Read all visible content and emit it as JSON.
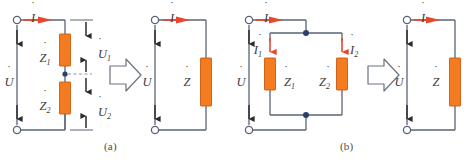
{
  "figure": {
    "type": "circuit-equivalence-diagram",
    "captions": [
      {
        "id": "a",
        "label": "(a)"
      },
      {
        "id": "b",
        "label": "(b)"
      }
    ],
    "colors": {
      "wire": "#5a6475",
      "impedance_fill": "#F47B20",
      "impedance_stroke": "#c85a10",
      "current_arrow": "#E8472B",
      "node_dot": "#2a3f6e",
      "terminal_stroke": "#5a6475",
      "terminal_fill": "#ffffff",
      "label_text": "#3b3b3b",
      "block_arrow_stroke": "#6b7380",
      "dashed_line": "#8a94a3",
      "caption_text": "#4a4a4a",
      "background": "#ffffff"
    }
  },
  "panel_a": {
    "name": "series-circuit-equivalence",
    "left_circuit": {
      "name": "series-circuit",
      "source_label": {
        "symbol": "U",
        "accent": "dot",
        "sub": ""
      },
      "current_label": {
        "symbol": "I",
        "accent": "dot",
        "sub": ""
      },
      "impedances": [
        {
          "symbol": "Z",
          "accent": "dot",
          "sub": "1"
        },
        {
          "symbol": "Z",
          "accent": "dot",
          "sub": "2"
        }
      ],
      "voltage_drops": [
        {
          "symbol": "U",
          "accent": "dot",
          "sub": "1"
        },
        {
          "symbol": "U",
          "accent": "dot",
          "sub": "2"
        }
      ],
      "terminals": 2,
      "midpoint_node": true
    },
    "arrow": {
      "name": "equivalence-arrow",
      "direction": "right"
    },
    "right_circuit": {
      "name": "equivalent-circuit",
      "source_label": {
        "symbol": "U",
        "accent": "dot",
        "sub": ""
      },
      "current_label": {
        "symbol": "I",
        "accent": "dot",
        "sub": ""
      },
      "impedances": [
        {
          "symbol": "Z",
          "accent": "dot",
          "sub": ""
        }
      ],
      "terminals": 2
    }
  },
  "panel_b": {
    "name": "parallel-circuit-equivalence",
    "left_circuit": {
      "name": "parallel-circuit",
      "source_label": {
        "symbol": "U",
        "accent": "dot",
        "sub": ""
      },
      "current_label": {
        "symbol": "I",
        "accent": "dot",
        "sub": ""
      },
      "branch_currents": [
        {
          "symbol": "I",
          "accent": "dot",
          "sub": "1"
        },
        {
          "symbol": "I",
          "accent": "dot",
          "sub": "2"
        }
      ],
      "impedances": [
        {
          "symbol": "Z",
          "accent": "dot",
          "sub": "1"
        },
        {
          "symbol": "Z",
          "accent": "dot",
          "sub": "2"
        }
      ],
      "terminals": 2,
      "junction_nodes": 2
    },
    "arrow": {
      "name": "equivalence-arrow",
      "direction": "right"
    },
    "right_circuit": {
      "name": "equivalent-circuit",
      "source_label": {
        "symbol": "U",
        "accent": "dot",
        "sub": ""
      },
      "current_label": {
        "symbol": "I",
        "accent": "dot",
        "sub": ""
      },
      "impedances": [
        {
          "symbol": "Z",
          "accent": "dot",
          "sub": ""
        }
      ],
      "terminals": 2
    }
  }
}
